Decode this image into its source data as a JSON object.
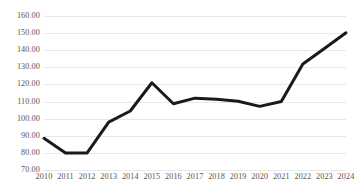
{
  "chart_data": {
    "type": "line",
    "title": "",
    "subtitle": "",
    "xlabel": "",
    "ylabel": "",
    "categories": [
      "2010",
      "2011",
      "2012",
      "2013",
      "2014",
      "2015",
      "2016",
      "2017",
      "2018",
      "2019",
      "2020",
      "2021",
      "2022",
      "2023",
      "2024"
    ],
    "values": [
      88.5,
      80.0,
      80.0,
      98.0,
      104.5,
      121.0,
      108.7,
      112.0,
      111.3,
      110.2,
      107.2,
      110.0,
      132.0,
      141.0,
      150.2
    ],
    "series": [
      {
        "name": "Series 1",
        "values": [
          88.5,
          80.0,
          80.0,
          98.0,
          104.5,
          121.0,
          108.7,
          112.0,
          111.3,
          110.2,
          107.2,
          110.0,
          132.0,
          141.0,
          150.2
        ],
        "color": "#1a1a1a"
      }
    ],
    "ylim": [
      70,
      160
    ],
    "ytick_labels": [
      "160.00",
      "150.00",
      "140.00",
      "130.00",
      "120.00",
      "110.00",
      "100.00",
      "90.00",
      "80.00",
      "70.00"
    ],
    "ytick_values": [
      160,
      150,
      140,
      130,
      120,
      110,
      100,
      90,
      80,
      70
    ],
    "xtick_labels": [
      "2010",
      "2011",
      "2012",
      "2013",
      "2014",
      "2015",
      "2016",
      "2017",
      "2018",
      "2019",
      "2020",
      "2021",
      "2022",
      "2023",
      "2024"
    ],
    "grid": true,
    "grid_axis": "y",
    "legend": false,
    "legend_position": "none",
    "markers": false,
    "line_width": 3
  },
  "style": {
    "background_color": "#ffffff",
    "gridline_color": "#e8e8e8",
    "axis_label_color": "#59534f",
    "line_color": "#1a1a1a"
  }
}
